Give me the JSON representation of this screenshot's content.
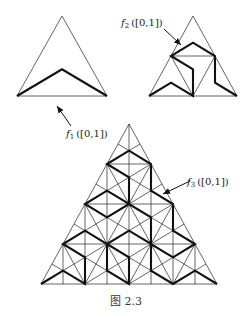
{
  "figure": {
    "caption": "图 2.3",
    "panels": [
      {
        "id": "f1",
        "level": 1,
        "label_func": "f",
        "label_sub": "1",
        "label_arg": "([0,1])",
        "description": "Triangle with path through centroid"
      },
      {
        "id": "f2",
        "level": 2,
        "label_func": "f",
        "label_sub": "2",
        "label_arg": "([0,1])",
        "description": "Triangle subdivided into 4; path visits each sub-triangle"
      },
      {
        "id": "f3",
        "level": 3,
        "label_func": "f",
        "label_sub": "3",
        "label_arg": "([0,1])",
        "description": "Triangle subdivided into 16; path visits each sub-triangle"
      }
    ],
    "colors": {
      "line": "#111111",
      "background": "#ffffff"
    }
  }
}
